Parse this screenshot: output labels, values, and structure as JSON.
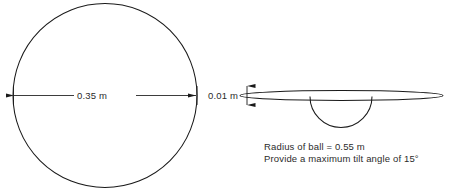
{
  "figure": {
    "background_color": "#ffffff",
    "stroke_color": "#1a1a1a",
    "text_color": "#2b2b2b"
  },
  "plan_view": {
    "shape": "circle",
    "diameter_label": "0.35 m"
  },
  "side_view": {
    "plate_shape": "ellipse",
    "ball_shape": "hemisphere-arc",
    "thickness_label": "0.01 m"
  },
  "caption": {
    "line1": "Radius of ball  =  0.55 m",
    "line2": "Provide a maximum tilt angle of 15°"
  }
}
